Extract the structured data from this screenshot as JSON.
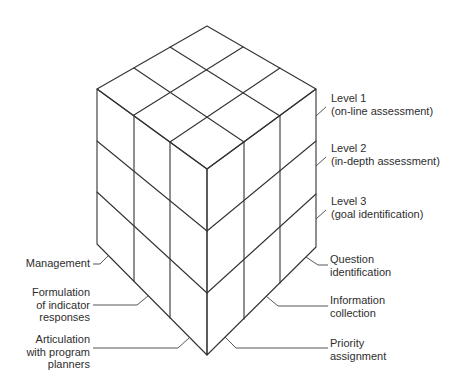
{
  "diagram": {
    "type": "3x3x3 cube matrix",
    "colors": {
      "line": "#333333",
      "text": "#2e2e2e",
      "background": "#ffffff"
    },
    "right_labels_top": [
      {
        "id": "level-1",
        "lines": [
          "Level 1",
          "(on-line assessment)"
        ]
      },
      {
        "id": "level-2",
        "lines": [
          "Level 2",
          "(in-depth assessment)"
        ]
      },
      {
        "id": "level-3",
        "lines": [
          "Level 3",
          "(goal identification)"
        ]
      }
    ],
    "right_labels_bottom": [
      {
        "id": "question-identification",
        "lines": [
          "Question",
          "identification"
        ]
      },
      {
        "id": "information-collection",
        "lines": [
          "Information",
          "collection"
        ]
      },
      {
        "id": "priority-assignment",
        "lines": [
          "Priority",
          "assignment"
        ]
      }
    ],
    "left_labels_bottom": [
      {
        "id": "management",
        "lines": [
          "Management"
        ]
      },
      {
        "id": "formulation",
        "lines": [
          "Formulation",
          "of indicator",
          "responses"
        ]
      },
      {
        "id": "articulation",
        "lines": [
          "Articulation",
          "with program",
          "planners"
        ]
      }
    ]
  }
}
